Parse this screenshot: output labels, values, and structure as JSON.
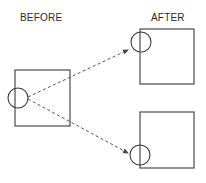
{
  "labels": {
    "before": "BEFORE",
    "after": "AFTER"
  },
  "colors": {
    "stroke": "#3a3a3a",
    "dash": "#555555",
    "text": "#2a2a2a",
    "background": "#ffffff"
  },
  "shapes": {
    "before_square": {
      "x": 15,
      "y": 70,
      "w": 55,
      "h": 56
    },
    "before_circle": {
      "cx": 18,
      "cy": 98,
      "r": 10
    },
    "after_top_square": {
      "x": 140,
      "y": 29,
      "w": 54,
      "h": 55
    },
    "after_top_circle": {
      "cx": 141,
      "cy": 42,
      "r": 10
    },
    "after_bottom_square": {
      "x": 140,
      "y": 112,
      "w": 54,
      "h": 56
    },
    "after_bottom_circle": {
      "cx": 140,
      "cy": 155,
      "r": 10
    },
    "arrow_top": {
      "x1": 28,
      "y1": 97,
      "x2": 128,
      "y2": 50
    },
    "arrow_bottom": {
      "x1": 28,
      "y1": 99,
      "x2": 128,
      "y2": 153
    }
  }
}
